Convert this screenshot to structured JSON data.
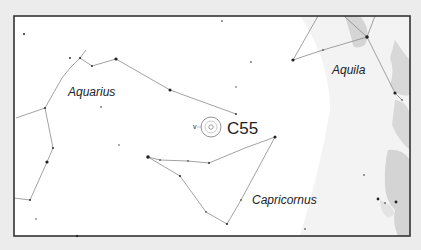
{
  "map": {
    "type": "star-chart",
    "frame": {
      "x": 14,
      "y": 16,
      "width": 396,
      "height": 220
    },
    "colors": {
      "background": "#ececec",
      "chart_bg": "#ffffff",
      "frame": "#333333",
      "lines": "#888888",
      "stars": "#222222",
      "milky_way_light": "#f0f0f0",
      "milky_way_dark": "#d2d2d2",
      "text": "#222222"
    },
    "constellations": [
      {
        "name": "Aquarius",
        "label_x": 68,
        "label_y": 96,
        "font_size": 12
      },
      {
        "name": "Aquila",
        "label_x": 332,
        "label_y": 74,
        "font_size": 12
      },
      {
        "name": "Capricornus",
        "label_x": 252,
        "label_y": 204,
        "font_size": 12
      }
    ],
    "object": {
      "label": "C55",
      "x": 211,
      "y": 127,
      "label_x": 227,
      "label_y": 134,
      "font_size": 17,
      "outer_radius": 10,
      "inner_radius": 3
    },
    "neighbor_label": {
      "text": "v",
      "x": 193,
      "y": 127
    }
  }
}
